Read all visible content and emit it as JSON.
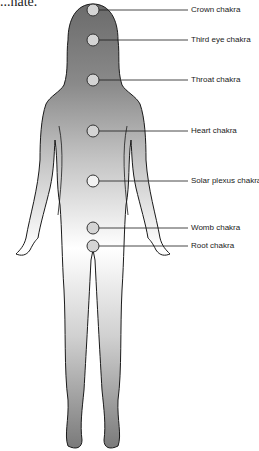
{
  "caption_fragment": "...nate.",
  "figure": {
    "colors": {
      "body_top": "#6e6e6e",
      "body_mid": "#ffffff",
      "body_bottom": "#8a8a8a",
      "outline": "#1a1a1a",
      "chakra_fill": "#d4d4d4"
    },
    "chakras": [
      {
        "label": "Crown chakra",
        "cx": 93,
        "cy": 10,
        "label_x": 190
      },
      {
        "label": "Third eye chakra",
        "cx": 93,
        "cy": 40,
        "label_x": 190
      },
      {
        "label": "Throat chakra",
        "cx": 93,
        "cy": 80,
        "label_x": 190
      },
      {
        "label": "Heart chakra",
        "cx": 93,
        "cy": 131,
        "label_x": 190
      },
      {
        "label": "Solar plexus chakra",
        "cx": 93,
        "cy": 181,
        "label_x": 190
      },
      {
        "label": "Womb chakra",
        "cx": 93,
        "cy": 228,
        "label_x": 190
      },
      {
        "label": "Root chakra",
        "cx": 93,
        "cy": 246,
        "label_x": 190
      }
    ]
  }
}
